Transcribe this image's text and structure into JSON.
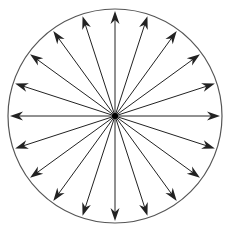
{
  "diagram": {
    "type": "radial-arrows",
    "title": "",
    "circle": {
      "cx": 115,
      "cy": 116,
      "r": 107,
      "stroke": "#555555"
    },
    "arrow_count": 20,
    "arrow_color": "#222222",
    "angles_deg": [
      0,
      18,
      36,
      54,
      72,
      90,
      108,
      126,
      144,
      162,
      180,
      198,
      216,
      234,
      252,
      270,
      288,
      306,
      324,
      342
    ],
    "center_dot": true
  }
}
